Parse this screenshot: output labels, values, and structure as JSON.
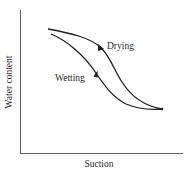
{
  "diagram": {
    "type": "soil-water-characteristic-hysteresis",
    "axes": {
      "x_label": "Suction",
      "y_label": "Water content"
    },
    "curves": [
      {
        "name": "drying",
        "label": "Drying",
        "direction": "toward higher suction"
      },
      {
        "name": "wetting",
        "label": "Wetting",
        "direction": "toward lower suction"
      }
    ],
    "colors": {
      "line": "#1e1e1e",
      "axis": "#555555",
      "text": "#2a2a2a",
      "background": "#ffffff"
    }
  }
}
